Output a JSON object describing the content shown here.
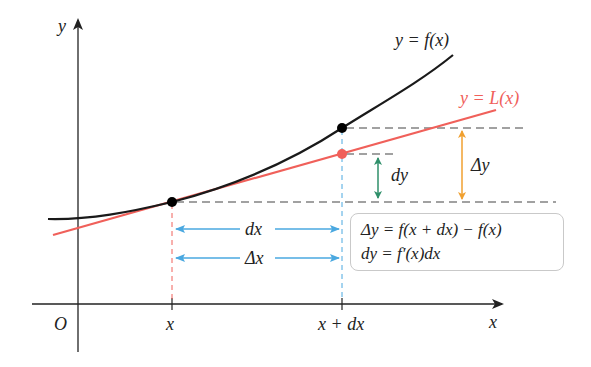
{
  "diagram": {
    "axes": {
      "x_label": "x",
      "y_label": "y",
      "origin_label": "O"
    },
    "curves": [
      {
        "name": "function-curve",
        "label": "y = f(x)",
        "color": "#1a1a1a"
      },
      {
        "name": "tangent-line",
        "label": "y = L(x)",
        "color": "#f0605a"
      }
    ],
    "tick_labels": {
      "x_tick": "x",
      "x_plus_dx_tick": "x + dx"
    },
    "horizontal_arrows": {
      "dx_label": "dx",
      "delta_x_label": "Δx",
      "color": "#4aa8e0"
    },
    "vertical_arrows": {
      "dy_label": "dy",
      "dy_color": "#2f8f6a",
      "delta_y_label": "Δy",
      "delta_y_color": "#f0a030"
    },
    "formula_box": {
      "line1": "Δy = f(x + dx) − f(x)",
      "line2": "dy = f′(x)dx"
    },
    "points": [
      {
        "name": "point-x-fx",
        "color": "#000000"
      },
      {
        "name": "point-xdx-fxdx",
        "color": "#000000"
      },
      {
        "name": "point-xdx-Lxdx",
        "color": "#f0605a"
      }
    ]
  }
}
